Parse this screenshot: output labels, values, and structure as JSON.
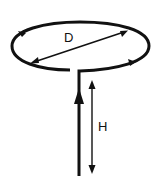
{
  "diagram": {
    "labels": {
      "diameter": "D",
      "height": "H"
    },
    "colors": {
      "stroke": "#111111",
      "background": "#ffffff"
    }
  }
}
